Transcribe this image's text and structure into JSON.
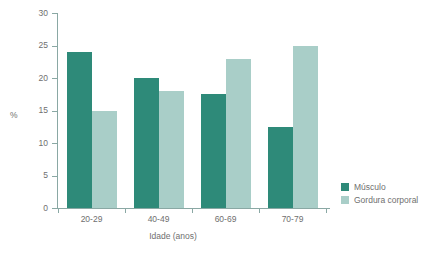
{
  "chart_data": {
    "type": "bar",
    "title": "",
    "subtitle": "",
    "xlabel": "Idade (anos)",
    "ylabel": "%",
    "categories": [
      "20-29",
      "40-49",
      "60-69",
      "70-79"
    ],
    "series": [
      {
        "name": "Músculo",
        "color": "#2e8a79",
        "values": [
          24,
          20,
          17.5,
          12.5
        ]
      },
      {
        "name": "Gordura corporal",
        "color": "#a9cec8",
        "values": [
          15,
          18,
          23,
          25
        ]
      }
    ],
    "ylim": [
      0,
      30
    ],
    "yticks": [
      0,
      5,
      10,
      15,
      20,
      25,
      30
    ],
    "ytick_labels": [
      "0",
      "5",
      "10",
      "15",
      "20",
      "25",
      "30"
    ],
    "grid": false,
    "legend_position": "right-bottom",
    "axis_color": "#8aa8a4",
    "text_color": "#6f6f6f",
    "background": "#ffffff"
  },
  "legend": {
    "entries": [
      {
        "label": "Músculo",
        "color": "#2e8a79"
      },
      {
        "label": "Gordura corporal",
        "color": "#a9cec8"
      }
    ]
  }
}
